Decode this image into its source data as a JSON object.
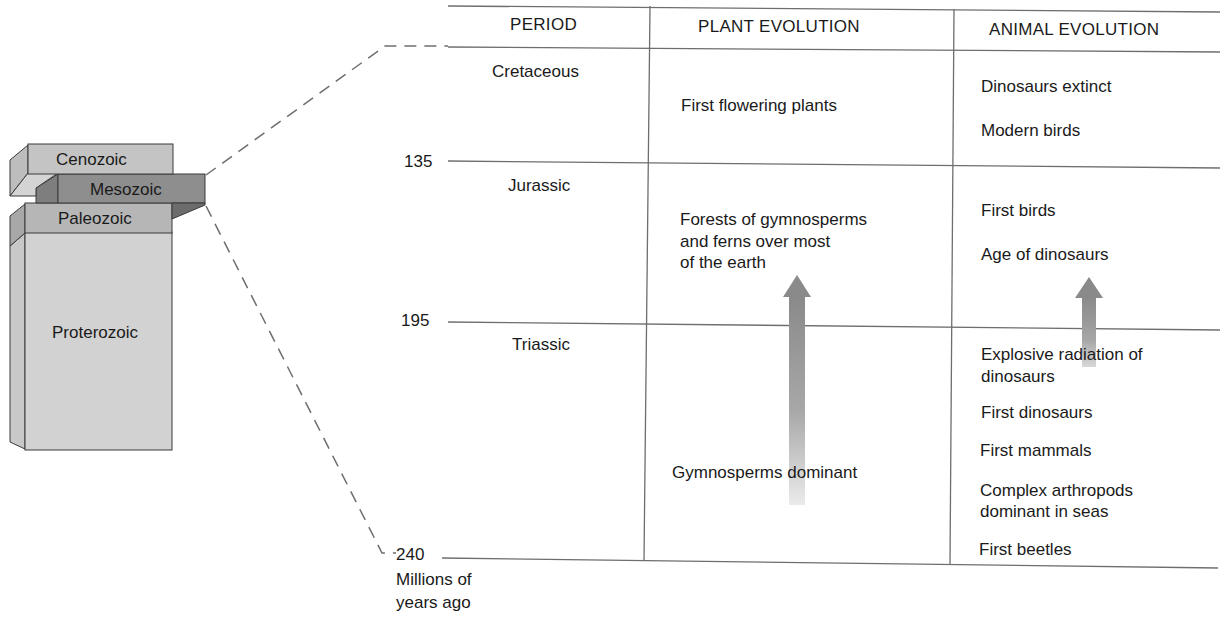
{
  "eras": {
    "cenozoic": "Cenozoic",
    "mesozoic": "Mesozoic",
    "paleozoic": "Paleozoic",
    "proterozoic": "Proterozoic"
  },
  "table": {
    "headers": [
      "PERIOD",
      "PLANT EVOLUTION",
      "ANIMAL EVOLUTION"
    ],
    "rows": [
      {
        "period": "Cretaceous",
        "plant": [
          "First flowering plants"
        ],
        "animal": [
          "Dinosaurs extinct",
          "Modern birds"
        ]
      },
      {
        "period": "Jurassic",
        "plant": [
          "Forests of gymnosperms",
          "and ferns over most",
          "of the earth"
        ],
        "animal": [
          "First birds",
          "Age of dinosaurs"
        ]
      },
      {
        "period": "Triassic",
        "plant": [
          "Gymnosperms dominant"
        ],
        "animal": [
          "Explosive radiation of",
          "dinosaurs",
          "First dinosaurs",
          "First mammals",
          "Complex arthropods",
          "dominant in seas",
          "First beetles"
        ]
      }
    ]
  },
  "axis": {
    "ticks": [
      "135",
      "195",
      "240"
    ],
    "unit_line1": "Millions of",
    "unit_line2": "years ago"
  },
  "colors": {
    "cenozoic": "#c4c4c4",
    "mesozoic": "#8c8c8c",
    "paleozoic": "#b0b0b0",
    "proterozoic": "#d0d0d0",
    "rule": "#6e6e6e",
    "arrow": "#8a8a8a"
  }
}
